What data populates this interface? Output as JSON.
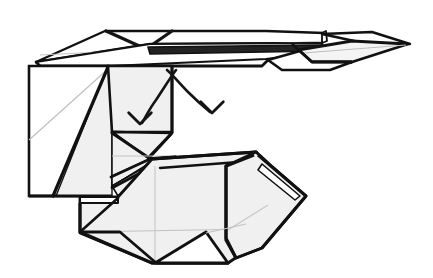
{
  "figure": {
    "title": "Origami folding step diagram",
    "type": "line-art-diagram",
    "caption": "",
    "width": 433,
    "height": 278
  },
  "palette": {
    "background": "#ffffff",
    "paper_white": "#ffffff",
    "paper_shaded": "#f0f0f0",
    "paper_shaded_alt": "#ececed",
    "edge_dark": "#111111",
    "edge_mid": "#1a1a1a",
    "crease_soft": "#b9b9b9",
    "crease_faint": "#c9c9c9",
    "arrow": "#141414"
  },
  "stroke_widths": {
    "outline_heavy": 3.4,
    "outline_medium": 2.3,
    "outline_light": 1.5,
    "crease_thin": 0.9,
    "arrow": 2.6
  },
  "parts": [
    {
      "id": "top-band",
      "name": "top-horizontal-band",
      "fill": "paper_white",
      "note": "long flat strip across the top"
    },
    {
      "id": "top-band-tip",
      "name": "top-band-right-tip",
      "fill": "paper_white",
      "note": "pointed diamond tip at right end"
    },
    {
      "id": "top-band-underside",
      "name": "top-band-underside-strip",
      "fill": "paper_shaded",
      "note": "thin dark strip beneath band"
    },
    {
      "id": "left-panel-white",
      "name": "left-panel-white-face",
      "fill": "paper_white",
      "note": "left vertical rectangle, unshaded"
    },
    {
      "id": "left-panel-shaded",
      "name": "left-panel-shaded-triangle",
      "fill": "paper_shaded",
      "note": "shaded wedge on right of left panel"
    },
    {
      "id": "mid-panel",
      "name": "middle-shaded-panel",
      "fill": "paper_shaded",
      "note": "square panel where arrows point"
    },
    {
      "id": "mid-wedges",
      "name": "middle-converging-wedges",
      "fill": "paper_shaded",
      "note": "thin wedges meeting at a central point"
    },
    {
      "id": "lower-body",
      "name": "lower-hexagonal-body",
      "fill": "paper_shaded",
      "note": "large angular form, bottom right"
    },
    {
      "id": "lower-right-flap",
      "name": "lower-right-flap",
      "fill": "paper_shaded",
      "note": "flap folded toward the right point"
    },
    {
      "id": "bottom-notch",
      "name": "bottom-white-triangle-notch",
      "fill": "paper_white",
      "note": "white triangular cut-out at the bottom"
    }
  ],
  "annotations": {
    "arrows": [
      {
        "id": "arrow-left",
        "name": "fold-arrow-down-left",
        "direction": "down-left",
        "tip_x": 141,
        "tip_y": 124,
        "tail_x": 176,
        "tail_y": 70
      },
      {
        "id": "arrow-right",
        "name": "fold-arrow-down-right",
        "direction": "down-right",
        "tip_x": 212,
        "tip_y": 113,
        "tail_x": 168,
        "tail_y": 70
      }
    ],
    "labels": [],
    "step_number": ""
  }
}
